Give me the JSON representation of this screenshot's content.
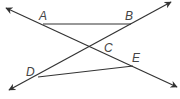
{
  "diagram": {
    "type": "geometry",
    "points": {
      "A": {
        "label": "A",
        "x": 43,
        "y": 24
      },
      "B": {
        "label": "B",
        "x": 131,
        "y": 24
      },
      "C": {
        "label": "C",
        "x": 91,
        "y": 47
      },
      "D": {
        "label": "D",
        "x": 38,
        "y": 77
      },
      "E": {
        "label": "E",
        "x": 133,
        "y": 66
      }
    },
    "lines": [
      {
        "name": "line-AE",
        "through": [
          "A",
          "C",
          "E"
        ],
        "arrows": "both"
      },
      {
        "name": "line-DB",
        "through": [
          "D",
          "C",
          "B"
        ],
        "arrows": "both"
      }
    ],
    "segments": [
      {
        "name": "segment-AB",
        "from": "A",
        "to": "B"
      },
      {
        "name": "segment-DE",
        "from": "D",
        "to": "E"
      }
    ],
    "colors": {
      "stroke": "#333333",
      "label": "#444444"
    }
  }
}
